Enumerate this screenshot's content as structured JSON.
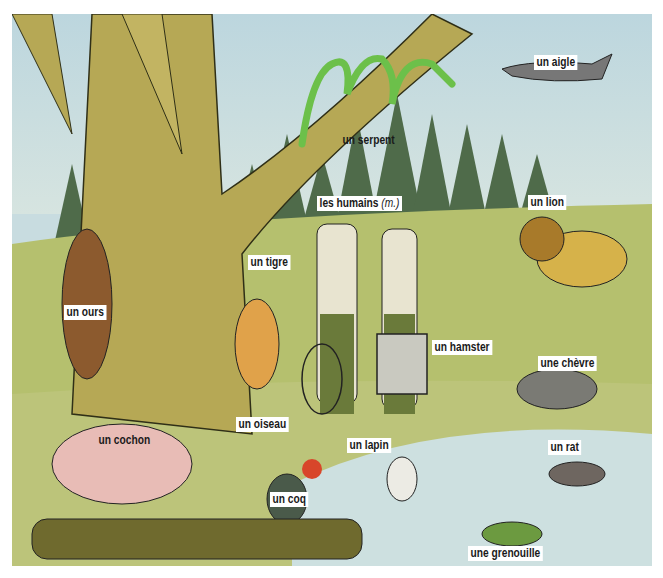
{
  "illustration": {
    "description": "Forest and meadow scene with labeled animals (French vocabulary)",
    "colors": {
      "sky": "#bcd6de",
      "meadow": "#b9c472",
      "forest": "#4f6b4a",
      "tree": "#b6a855",
      "pond": "#cde0e0",
      "label_bg": "#ffffff",
      "label_text": "#1a1a1a"
    }
  },
  "labels": {
    "aigle": "un aigle",
    "serpent": "un serpent",
    "humains": "les humains",
    "humains_note": "(m.)",
    "lion": "un lion",
    "tigre": "un tigre",
    "ours": "un ours",
    "hamster": "un hamster",
    "chevre": "une chèvre",
    "oiseau": "un oiseau",
    "cochon": "un cochon",
    "lapin": "un lapin",
    "rat": "un rat",
    "coq": "un coq",
    "grenouille": "une grenouille"
  }
}
